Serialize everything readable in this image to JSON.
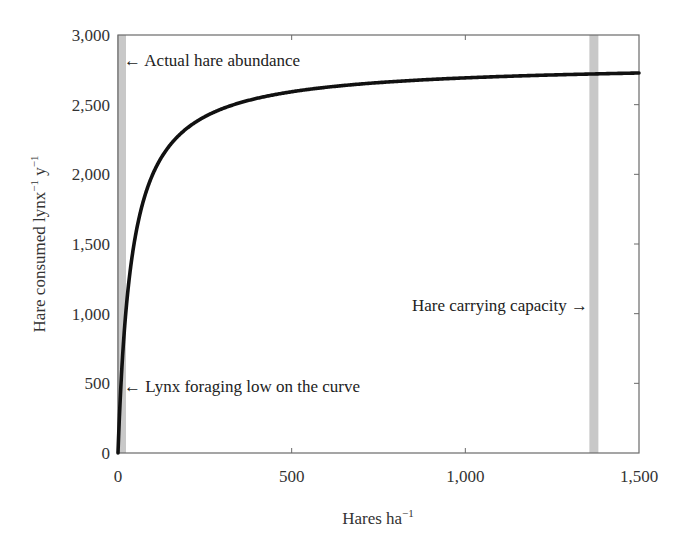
{
  "chart_data": {
    "type": "line",
    "title": "",
    "xlabel": "Hares ha",
    "xlabel_superscript": "−1",
    "ylabel": "Hare consumed lynx",
    "ylabel_superscript_1": "−1",
    "ylabel_mid": " y",
    "ylabel_superscript_2": "−1",
    "xlim": [
      0,
      1500
    ],
    "ylim": [
      0,
      3000
    ],
    "grid": false,
    "legend": null,
    "x_ticks": [
      0,
      500,
      1000,
      1500
    ],
    "x_tick_labels": [
      "0",
      "500",
      "1,000",
      "1,500"
    ],
    "y_ticks": [
      0,
      500,
      1000,
      1500,
      2000,
      2500,
      3000
    ],
    "y_tick_labels": [
      "0",
      "500",
      "1,000",
      "1,500",
      "2,000",
      "2,500",
      "3,000"
    ],
    "series": [
      {
        "name": "Functional response (Holling type II)",
        "color": "#111111",
        "model": {
          "form": "a*x/(b+x)",
          "a": 2800,
          "b": 40
        },
        "x": [
          0,
          5,
          10,
          20,
          30,
          50,
          75,
          100,
          150,
          200,
          300,
          400,
          500,
          750,
          1000,
          1250,
          1500
        ],
        "y": [
          0,
          311,
          560,
          933,
          1200,
          1556,
          1826,
          2000,
          2211,
          2333,
          2471,
          2545,
          2593,
          2658,
          2692,
          2713,
          2727
        ]
      }
    ],
    "bands": [
      {
        "name": "actual-hare-abundance",
        "x_start": 0,
        "x_end": 12,
        "color": "#c8c8c8"
      },
      {
        "name": "hare-carrying-capacity",
        "x_start": 1360,
        "x_end": 1385,
        "color": "#c8c8c8"
      }
    ],
    "annotations": [
      {
        "text": "← Actual hare abundance",
        "x": 12,
        "y": 2800
      },
      {
        "text": "Hare carrying capacity →",
        "x": 1360,
        "y": 1000
      },
      {
        "text": "← Lynx foraging low on the curve",
        "x": 12,
        "y": 450
      }
    ]
  },
  "labels": {
    "actual_abundance": "← Actual hare abundance",
    "carrying_capacity": "Hare carrying capacity →",
    "lynx_foraging": "← Lynx foraging low on the curve"
  }
}
